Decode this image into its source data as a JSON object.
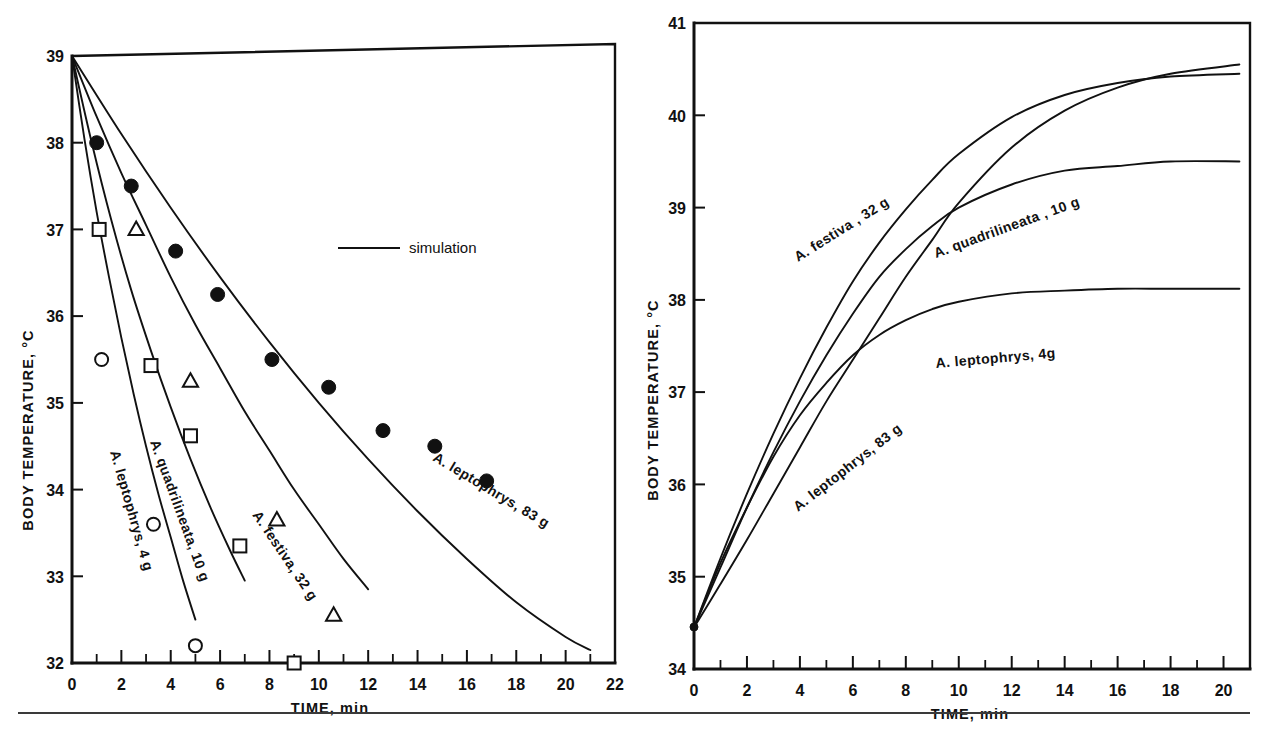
{
  "figure": {
    "name": "body-temperature-vs-time-figure",
    "panel_count": 2
  },
  "chart_data": [
    {
      "id": "cooling",
      "type": "line",
      "title": "",
      "xlabel": "TIME, min",
      "ylabel": "BODY TEMPERATURE, °C",
      "xlim": [
        0,
        22
      ],
      "ylim": [
        32,
        39
      ],
      "xticks": [
        0,
        2,
        4,
        6,
        8,
        10,
        12,
        14,
        16,
        18,
        20,
        22
      ],
      "xticklabels": [
        "0",
        "2",
        "4",
        "6",
        "8",
        "10",
        "12",
        "14",
        "16",
        "18",
        "20",
        "22"
      ],
      "xminor_step": 1,
      "yticks": [
        32,
        33,
        34,
        35,
        36,
        37,
        38,
        39
      ],
      "yticklabels": [
        "32",
        "33",
        "34",
        "35",
        "36",
        "37",
        "38",
        "39"
      ],
      "grid": false,
      "legend": [
        {
          "label": "simulation",
          "marker": "line"
        }
      ],
      "annotations": [
        {
          "text": "A. leptophrys, 4 g",
          "series": "A. leptophrys, 4 g"
        },
        {
          "text": "A. quadrilineata, 10 g",
          "series": "A. quadrilineata, 10 g"
        },
        {
          "text": "A. festiva, 32 g",
          "series": "A. festiva, 32 g"
        },
        {
          "text": "A. leptophrys, 83 g",
          "series": "A. leptophrys, 83 g"
        }
      ],
      "series": [
        {
          "name": "A. leptophrys, 4 g",
          "kind": "simulation-curve",
          "marker": "open-circle",
          "x": [
            0,
            0.5,
            1,
            1.5,
            2,
            2.5,
            3,
            3.5,
            4,
            4.5,
            5
          ],
          "values": [
            39.0,
            38.05,
            37.2,
            36.45,
            35.75,
            35.1,
            34.5,
            33.95,
            33.45,
            32.95,
            32.5
          ]
        },
        {
          "name": "A. quadrilineata, 10 g",
          "kind": "simulation-curve",
          "marker": "open-square",
          "x": [
            0,
            0.8,
            1.6,
            2.4,
            3.2,
            4,
            4.8,
            5.6,
            6.4,
            7
          ],
          "values": [
            39.0,
            38.0,
            37.1,
            36.3,
            35.6,
            34.95,
            34.35,
            33.8,
            33.3,
            32.95
          ]
        },
        {
          "name": "A. festiva, 32 g",
          "kind": "simulation-curve",
          "marker": "open-triangle",
          "x": [
            0,
            1,
            2,
            3,
            4,
            5,
            6,
            7,
            8,
            9,
            10,
            11,
            12
          ],
          "values": [
            39.0,
            38.3,
            37.65,
            37.05,
            36.45,
            35.9,
            35.4,
            34.9,
            34.45,
            34.0,
            33.6,
            33.2,
            32.85
          ]
        },
        {
          "name": "A. leptophrys, 83 g",
          "kind": "simulation-curve",
          "marker": "filled-circle",
          "x": [
            0,
            2,
            4,
            6,
            8,
            10,
            12,
            14,
            16,
            18,
            20,
            21
          ],
          "values": [
            39.0,
            38.1,
            37.25,
            36.45,
            35.7,
            35.0,
            34.35,
            33.75,
            33.2,
            32.7,
            32.3,
            32.15
          ]
        }
      ],
      "data_points": [
        {
          "series": "A. leptophrys, 83 g",
          "marker": "filled-circle",
          "points": [
            [
              1.0,
              38.0
            ],
            [
              2.4,
              37.5
            ],
            [
              4.2,
              36.75
            ],
            [
              5.9,
              36.25
            ],
            [
              8.1,
              35.5
            ],
            [
              10.4,
              35.18
            ],
            [
              12.6,
              34.68
            ],
            [
              14.7,
              34.5
            ],
            [
              16.8,
              34.1
            ]
          ]
        },
        {
          "series": "A. festiva, 32 g",
          "marker": "open-triangle",
          "points": [
            [
              2.6,
              37.0
            ],
            [
              4.8,
              35.25
            ],
            [
              8.3,
              33.65
            ],
            [
              10.6,
              32.55
            ]
          ]
        },
        {
          "series": "A. quadrilineata, 10 g",
          "marker": "open-square",
          "points": [
            [
              1.1,
              37.0
            ],
            [
              3.2,
              35.43
            ],
            [
              4.8,
              34.62
            ],
            [
              6.8,
              33.35
            ],
            [
              9.0,
              32.0
            ]
          ]
        },
        {
          "series": "A. leptophrys, 4 g",
          "marker": "open-circle",
          "points": [
            [
              1.2,
              35.5
            ],
            [
              3.3,
              33.6
            ],
            [
              5.0,
              32.2
            ]
          ]
        }
      ]
    },
    {
      "id": "warming",
      "type": "line",
      "title": "",
      "xlabel": "TIME, min",
      "ylabel": "BODY TEMPERATURE, °C",
      "xlim": [
        0,
        21
      ],
      "ylim": [
        34,
        41
      ],
      "xticks": [
        0,
        2,
        4,
        6,
        8,
        10,
        12,
        14,
        16,
        18,
        20
      ],
      "xticklabels": [
        "0",
        "2",
        "4",
        "6",
        "8",
        "10",
        "12",
        "14",
        "16",
        "18",
        "20"
      ],
      "xminor_step": 1,
      "yticks": [
        34,
        35,
        36,
        37,
        38,
        39,
        40,
        41
      ],
      "yticklabels": [
        "34",
        "35",
        "36",
        "37",
        "38",
        "39",
        "40",
        "41"
      ],
      "grid": false,
      "start_temperature": 34.45,
      "annotations": [
        {
          "text": "A. festiva , 32 g",
          "series": "A. festiva, 32 g"
        },
        {
          "text": "A. quadrilineata , 10 g",
          "series": "A. quadrilineata, 10 g"
        },
        {
          "text": "A. leptophrys, 4 g",
          "series": "A. leptophrys, 4 g"
        },
        {
          "text": "A. leptophrys, 83 g",
          "series": "A. leptophrys, 83 g"
        }
      ],
      "series": [
        {
          "name": "A. leptophrys, 4 g",
          "x": [
            0,
            1,
            2,
            3,
            4,
            5,
            6,
            7,
            8,
            9,
            10,
            12,
            14,
            16,
            18,
            20.6
          ],
          "values": [
            34.45,
            35.15,
            35.75,
            36.3,
            36.75,
            37.1,
            37.4,
            37.62,
            37.78,
            37.9,
            37.98,
            38.07,
            38.1,
            38.12,
            38.12,
            38.12
          ]
        },
        {
          "name": "A. quadrilineata, 10 g",
          "x": [
            0,
            1,
            2,
            3,
            4,
            5,
            6,
            7,
            8,
            9,
            10,
            12,
            14,
            16,
            18,
            20.6
          ],
          "values": [
            34.45,
            35.1,
            35.75,
            36.35,
            36.9,
            37.4,
            37.85,
            38.25,
            38.55,
            38.8,
            39.0,
            39.25,
            39.4,
            39.45,
            39.5,
            39.5
          ]
        },
        {
          "name": "A. leptophrys, 83 g",
          "x": [
            0,
            1,
            2,
            3,
            4,
            5,
            6,
            7,
            8,
            9,
            10,
            12,
            14,
            16,
            18,
            20.6
          ],
          "values": [
            34.45,
            34.92,
            35.4,
            35.9,
            36.4,
            36.9,
            37.35,
            37.8,
            38.25,
            38.65,
            39.05,
            39.65,
            40.05,
            40.3,
            40.45,
            40.55
          ]
        },
        {
          "name": "A. festiva, 32 g",
          "x": [
            0,
            1,
            2,
            3,
            4,
            5,
            6,
            7,
            8,
            9,
            10,
            12,
            14,
            16,
            18,
            20.6
          ],
          "values": [
            34.45,
            35.2,
            35.9,
            36.55,
            37.15,
            37.7,
            38.2,
            38.62,
            38.98,
            39.3,
            39.58,
            39.98,
            40.22,
            40.35,
            40.42,
            40.45
          ]
        }
      ]
    }
  ],
  "left_chart": {
    "ylabel": "BODY  TEMPERATURE,  °C",
    "xlabel": "TIME, min",
    "legend_label": "simulation",
    "curve_labels": {
      "leptophrys_4g": "A. leptophrys, 4 g",
      "quadrilineata_10g": "A. quadrilineata, 10 g",
      "festiva_32g": "A. festiva, 32 g",
      "leptophrys_83g": "A. leptophrys, 83 g"
    },
    "y_ticklabels": [
      "39",
      "38",
      "37",
      "36",
      "35",
      "34",
      "33",
      "32"
    ],
    "x_ticklabels": [
      "0",
      "2",
      "4",
      "6",
      "8",
      "10",
      "12",
      "14",
      "16",
      "18",
      "20",
      "22"
    ]
  },
  "right_chart": {
    "ylabel": "BODY  TEMPERATURE,  °C",
    "xlabel": "TIME, min",
    "curve_labels": {
      "festiva_32g": "A. festiva , 32 g",
      "quadrilineata_10g": "A. quadrilineata , 10 g",
      "leptophrys_4g": "A. leptophrys, 4g",
      "leptophrys_83g": "A. leptophrys, 83 g"
    },
    "y_ticklabels": [
      "41",
      "40",
      "39",
      "38",
      "37",
      "36",
      "35",
      "34"
    ],
    "x_ticklabels": [
      "0",
      "2",
      "4",
      "6",
      "8",
      "10",
      "12",
      "14",
      "16",
      "18",
      "20"
    ]
  }
}
